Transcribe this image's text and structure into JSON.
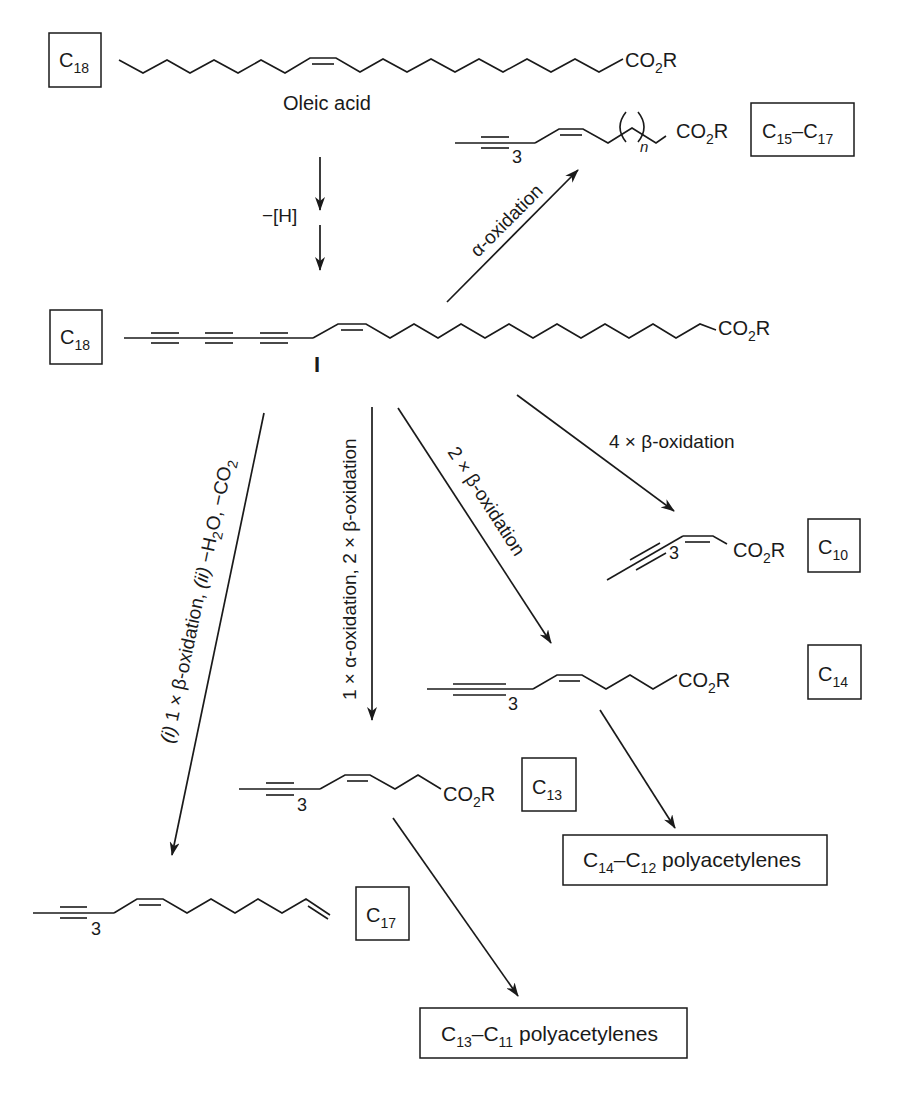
{
  "diagram": {
    "type": "biosynthetic-scheme",
    "colors": {
      "ink": "#1a1a1a",
      "background": "#ffffff"
    }
  },
  "compounds": {
    "oleic": {
      "box_main": "C",
      "box_sub": "18",
      "name": "Oleic acid",
      "group_main": "CO",
      "group_sub": "2",
      "group_tail": "R"
    },
    "intermediate": {
      "box_main": "C",
      "box_sub": "18",
      "label": "I",
      "group_main": "CO",
      "group_sub": "2",
      "group_tail": "R"
    },
    "c15_c17": {
      "box_main1": "C",
      "box_sub1": "15",
      "dash": "–",
      "box_main2": "C",
      "box_sub2": "17",
      "repeat": "3",
      "n": "n",
      "group_main": "CO",
      "group_sub": "2",
      "group_tail": "R"
    },
    "c10": {
      "box_main": "C",
      "box_sub": "10",
      "repeat": "3",
      "group_main": "CO",
      "group_sub": "2",
      "group_tail": "R"
    },
    "c14": {
      "box_main": "C",
      "box_sub": "14",
      "repeat": "3",
      "group_main": "CO",
      "group_sub": "2",
      "group_tail": "R"
    },
    "c13": {
      "box_main": "C",
      "box_sub": "13",
      "repeat": "3",
      "group_main": "CO",
      "group_sub": "2",
      "group_tail": "R"
    },
    "c17": {
      "box_main": "C",
      "box_sub": "17",
      "repeat": "3"
    }
  },
  "products": {
    "c14_c12": {
      "main1": "C",
      "sub1": "14",
      "dash": "–",
      "main2": "C",
      "sub2": "12",
      "text": " polyacetylenes"
    },
    "c13_c11": {
      "main1": "C",
      "sub1": "13",
      "dash": "–",
      "main2": "C",
      "sub2": "11",
      "text": " polyacetylenes"
    }
  },
  "conditions": {
    "dehydrogenation": "−[H]",
    "alpha_oxidation": "α-oxidation",
    "beta4": "4 × β-oxidation",
    "beta2": "2 × β-oxidation",
    "alpha_beta2": "1 × α-oxidation, 2 × β-oxidation",
    "beta1_decarb": {
      "i": "(i)",
      "part1": " 1 × β-oxidation, ",
      "ii": "(ii)",
      "part2": " −H",
      "sub_2": "2",
      "part3": "O, −CO",
      "sub_3": "2"
    }
  }
}
